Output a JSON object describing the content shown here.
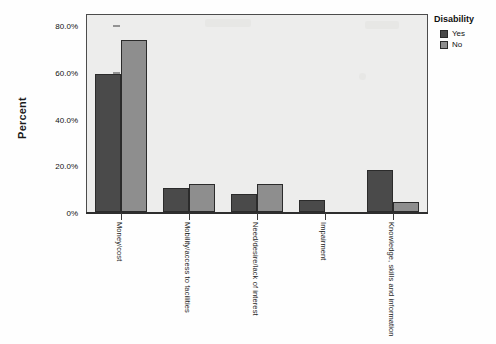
{
  "chart_data": {
    "type": "bar",
    "title": "",
    "xlabel": "",
    "ylabel": "Percent",
    "ylim": [
      0,
      80
    ],
    "grid": false,
    "legend_position": "right",
    "legend_title": "Disability",
    "categories": [
      "Money/cost",
      "Mobility/access to facilities",
      "Need/desire/lack of interest",
      "Impairment",
      "Knowledge, skills and information"
    ],
    "ytick_labels": [
      "0%",
      "20.0%",
      "40.0%",
      "60.0%",
      "80.0%"
    ],
    "ytick_values": [
      0,
      20,
      40,
      60,
      80
    ],
    "series": [
      {
        "name": "Yes",
        "color": "#4a4a4a",
        "values": [
          59.0,
          10.3,
          7.5,
          5.0,
          17.8
        ]
      },
      {
        "name": "No",
        "color": "#8e8e8e",
        "values": [
          73.7,
          12.0,
          12.0,
          0.0,
          4.3
        ]
      }
    ]
  },
  "legend": {
    "title": "Disability",
    "entries": [
      {
        "label": "Yes"
      },
      {
        "label": "No"
      }
    ]
  },
  "axis": {
    "y_title": "Percent"
  }
}
